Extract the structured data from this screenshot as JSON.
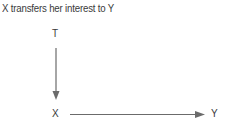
{
  "title": "X transfers her interest to Y",
  "nodes": {
    "top": "T",
    "origin": "X",
    "target": "Y"
  },
  "edges": [
    {
      "from": "T",
      "to": "X",
      "direction": "down"
    },
    {
      "from": "X",
      "to": "Y",
      "direction": "right"
    }
  ],
  "colors": {
    "line": "#6b6b6b",
    "text": "#3a3a3a"
  }
}
